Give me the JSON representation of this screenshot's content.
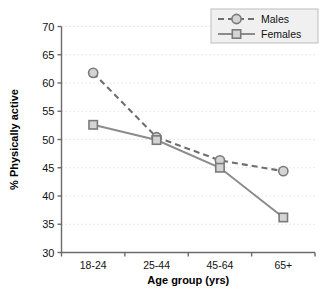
{
  "chart_data": {
    "type": "line",
    "title": "",
    "xlabel": "Age group (yrs)",
    "ylabel": "% Physically active",
    "categories": [
      "18-24",
      "25-44",
      "45-64",
      "65+"
    ],
    "ylim": [
      30,
      70
    ],
    "yticks": [
      30,
      35,
      40,
      45,
      50,
      55,
      60,
      65,
      70
    ],
    "ytick_labels": [
      "30",
      "35",
      "40",
      "45",
      "50",
      "55",
      "60",
      "65",
      "70"
    ],
    "grid": true,
    "legend_position": "top-right",
    "series": [
      {
        "name": "Males",
        "values": [
          61.8,
          50.4,
          46.3,
          44.4
        ],
        "line_style": "dashed",
        "marker": "circle",
        "color": "#6e6e6e"
      },
      {
        "name": "Females",
        "values": [
          52.6,
          49.9,
          45.0,
          36.2
        ],
        "line_style": "solid",
        "marker": "square",
        "color": "#8c8c8c"
      }
    ]
  },
  "legend": {
    "items": [
      {
        "label": "Males"
      },
      {
        "label": "Females"
      }
    ]
  },
  "colors": {
    "males_line": "#6e6e6e",
    "females_line": "#8c8c8c",
    "marker_fill": "#d4d4d4",
    "marker_stroke": "#7a7a7a",
    "gridline": "#e8e0e2",
    "axis": "#6b6b6b",
    "legend_bg": "#f0f0f0",
    "legend_border": "#bdbdbd",
    "text": "#111111",
    "background": "#ffffff"
  }
}
